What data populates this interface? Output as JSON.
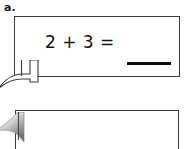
{
  "worksheet": {
    "problem_label": "a.",
    "callouts": [
      {
        "id": "callout-one",
        "equation": "2 + 3 =",
        "has_answer_blank": true,
        "answer_value": "",
        "tail_style": "outline-ribbon"
      },
      {
        "id": "callout-two",
        "equation": "",
        "has_answer_blank": false,
        "answer_value": "",
        "tail_style": "gray-gradient-ribbon"
      }
    ]
  },
  "colors": {
    "page_background": "#ffffff",
    "box_border": "#3a3a3a",
    "text": "#111111",
    "blank_line": "#0d0d0d",
    "tail_gradient_light": "#f2f2f2",
    "tail_gradient_dark": "#6e6e6e"
  },
  "icons": {
    "ribbon_tail": "speech-bubble-tail-icon"
  }
}
